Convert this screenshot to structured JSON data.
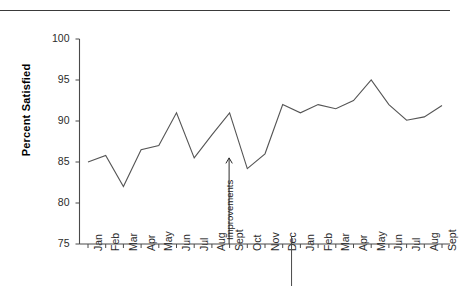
{
  "chart_data": {
    "type": "line",
    "title": "",
    "xlabel": "",
    "ylabel": "Percent Satisfied",
    "ylim": [
      75,
      100
    ],
    "ytick_labels": [
      "100",
      "95",
      "90",
      "85",
      "80",
      "75"
    ],
    "ytick_values": [
      100,
      95,
      90,
      85,
      80,
      75
    ],
    "grid": false,
    "legend": "none",
    "categories": [
      "Jan",
      "Feb",
      "Mar",
      "Apr",
      "May",
      "Jun",
      "Jul",
      "Aug",
      "Sept",
      "Oct",
      "Nov",
      "Dec",
      "Jan",
      "Feb",
      "Mar",
      "Apr",
      "May",
      "Jun",
      "Jul",
      "Aug",
      "Sept"
    ],
    "values": [
      85,
      85.8,
      82,
      86.5,
      87,
      91,
      85.5,
      88.3,
      91,
      84.2,
      86,
      92,
      91,
      92,
      91.5,
      92.5,
      95,
      92,
      90.1,
      90.5,
      91.9
    ],
    "series": [
      {
        "name": "Percent Satisfied",
        "values": [
          85,
          85.8,
          82,
          86.5,
          87,
          91,
          85.5,
          88.3,
          91,
          84.2,
          86,
          92,
          91,
          92,
          91.5,
          92.5,
          95,
          92,
          90.1,
          90.5,
          91.9
        ],
        "color": "#555555"
      }
    ],
    "annotations": [
      {
        "label": "Improvements",
        "type": "vertical-arrow",
        "at_category": "Sept",
        "at_index": 8,
        "from_value": 75,
        "to_value": 85.5
      }
    ],
    "dividers": [
      {
        "type": "year-separator",
        "after_category": "Dec",
        "after_index": 11
      }
    ]
  },
  "axis": {
    "y_title": "Percent Satisfied"
  }
}
